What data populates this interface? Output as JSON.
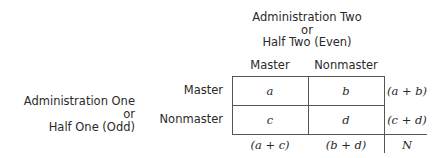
{
  "column_header": {
    "line1": "Administration Two",
    "line2": "or",
    "line3": "Half Two (Even)"
  },
  "row_header": {
    "line1": "Administration One or",
    "line2": "Half One (Odd)"
  },
  "columns": [
    "Master",
    "Nonmaster"
  ],
  "rows": [
    "Master",
    "Nonmaster"
  ],
  "cells": [
    [
      "a",
      "b"
    ],
    [
      "c",
      "d"
    ]
  ],
  "row_totals": [
    "(a + b)",
    "(c + d)"
  ],
  "column_totals": [
    "(a + c)",
    "(b + d)"
  ],
  "grand_total": "N"
}
